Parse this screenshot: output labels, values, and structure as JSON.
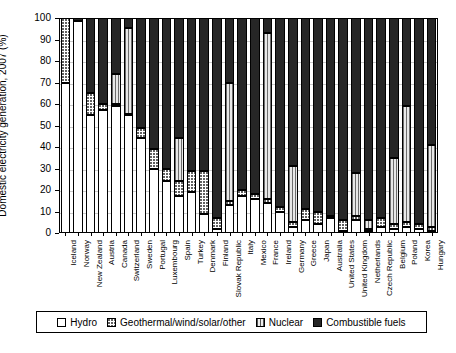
{
  "chart_data": {
    "type": "bar",
    "stacked": true,
    "title": "",
    "xlabel": "",
    "ylabel": "Domestic electricity generation, 2007 (%)",
    "ylim": [
      0,
      100
    ],
    "yticks": [
      0,
      10,
      20,
      30,
      40,
      50,
      60,
      70,
      80,
      90,
      100
    ],
    "grid": true,
    "legend_position": "bottom",
    "series": [
      {
        "name": "Hydro",
        "pattern": "white",
        "values": [
          70,
          98.5,
          55,
          57,
          59,
          55,
          44,
          30,
          24,
          17,
          19,
          9,
          2,
          13,
          17,
          16,
          14,
          10,
          3,
          6,
          4,
          7,
          1,
          6,
          1,
          3,
          2,
          3,
          2,
          1
        ]
      },
      {
        "name": "Geothermal/wind/solar/other",
        "pattern": "dotted",
        "values": [
          30,
          0.3,
          10,
          3,
          1,
          0.5,
          5,
          9,
          6,
          7,
          10,
          20,
          5,
          2,
          3,
          2,
          2,
          2,
          2,
          5,
          6,
          1,
          5,
          2,
          1,
          4,
          2,
          2,
          2,
          2
        ]
      },
      {
        "name": "Nuclear",
        "pattern": "vertical-stripes",
        "values": [
          0,
          0,
          0,
          0,
          14,
          40,
          0,
          0,
          0,
          20,
          0,
          0,
          0,
          55,
          0,
          0,
          77,
          0,
          26,
          0,
          0,
          0,
          0,
          20,
          4,
          0,
          31,
          54,
          0,
          38
        ]
      },
      {
        "name": "Combustible fuels",
        "pattern": "black",
        "values": [
          0,
          1.2,
          35,
          40,
          26,
          4.5,
          51,
          61,
          70,
          56,
          71,
          71,
          93,
          30,
          80,
          82,
          7,
          88,
          69,
          89,
          90,
          92,
          94,
          72,
          94,
          93,
          65,
          41,
          96,
          59
        ]
      }
    ],
    "categories": [
      "Iceland",
      "Norway",
      "New Zealand",
      "Austria",
      "Canada",
      "Switzerland",
      "Sweden",
      "Portugal",
      "Luxembourg",
      "Spain",
      "Turkey",
      "Denmark",
      "Finland",
      "Slovak Republic",
      "Italy",
      "Mexico",
      "France",
      "Ireland",
      "Germany",
      "Greece",
      "Japan",
      "Australia",
      "United States",
      "United Kingdom",
      "Netherlands",
      "Czech Republic",
      "Belgium",
      "Poland",
      "Korea",
      "Hungary"
    ]
  },
  "legend": {
    "items": [
      {
        "label": "Hydro",
        "key": "hydro"
      },
      {
        "label": "Geothermal/wind/solar/other",
        "key": "geo"
      },
      {
        "label": "Nuclear",
        "key": "nuc"
      },
      {
        "label": "Combustible fuels",
        "key": "comb"
      }
    ]
  },
  "colors": {
    "combustible": "#262626",
    "nuclear": "#6e6e6e",
    "grid": "#c9c9c9",
    "axis": "#000000",
    "background": "#ffffff"
  }
}
